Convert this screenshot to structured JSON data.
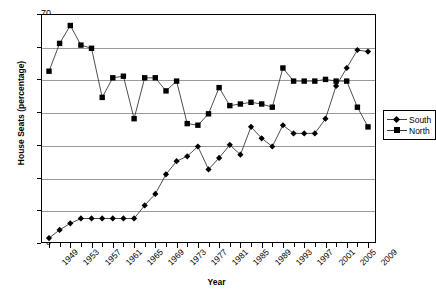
{
  "chart_data": {
    "type": "line",
    "title": "",
    "xlabel": "Year",
    "ylabel": "House Seats (percentage)",
    "ylim": [
      0,
      70
    ],
    "ytick_step": 10,
    "yticks": [
      0,
      10,
      20,
      30,
      40,
      50,
      60,
      70
    ],
    "grid": true,
    "legend_position": "right-outside",
    "x": [
      1949,
      1951,
      1953,
      1955,
      1957,
      1959,
      1961,
      1963,
      1965,
      1967,
      1969,
      1971,
      1973,
      1975,
      1977,
      1979,
      1981,
      1983,
      1985,
      1987,
      1989,
      1991,
      1993,
      1995,
      1997,
      1999,
      2001,
      2003,
      2005,
      2007,
      2009
    ],
    "xtick_labels": [
      "1949",
      "1953",
      "1957",
      "1961",
      "1965",
      "1969",
      "1973",
      "1977",
      "1981",
      "1985",
      "1989",
      "1993",
      "1997",
      "2001",
      "2005",
      "2009"
    ],
    "xtick_label_step_years": 4,
    "xtick_step_years": 2,
    "series": [
      {
        "name": "South",
        "marker": "diamond",
        "values": [
          1.5,
          4.0,
          6.0,
          7.5,
          7.5,
          7.5,
          7.5,
          7.5,
          7.5,
          11.5,
          15.0,
          21.0,
          25.0,
          26.5,
          29.5,
          22.5,
          26.0,
          30.0,
          27.0,
          35.5,
          32.0,
          29.5,
          36.0,
          33.5,
          33.5,
          33.5,
          38.0,
          48.0,
          53.5,
          59.0,
          58.5
        ]
      },
      {
        "name": "North",
        "marker": "square",
        "values": [
          52.5,
          61.0,
          66.5,
          60.5,
          59.5,
          44.5,
          50.5,
          51.0,
          38.0,
          50.5,
          50.5,
          46.5,
          49.5,
          36.5,
          36.0,
          39.5,
          47.5,
          42.0,
          42.5,
          43.0,
          42.5,
          41.5,
          53.5,
          49.5,
          49.5,
          49.5,
          50.0,
          49.5,
          49.5,
          41.5,
          35.5
        ]
      }
    ],
    "series_late": {
      "south_tail": [
        59.0,
        63.0,
        55.5
      ],
      "north_tail": [
        49.5,
        41.5,
        35.5
      ]
    }
  },
  "legend": {
    "items": [
      {
        "label": "South",
        "marker": "diamond"
      },
      {
        "label": "North",
        "marker": "square"
      }
    ]
  },
  "axes": {
    "y_title": "House Seats (percentage)",
    "x_title": "Year"
  },
  "colors": {
    "line": "#3a3a3a",
    "marker": "#000000",
    "grid": "#9a9a9a",
    "frame": "#000000",
    "background": "#ffffff"
  }
}
